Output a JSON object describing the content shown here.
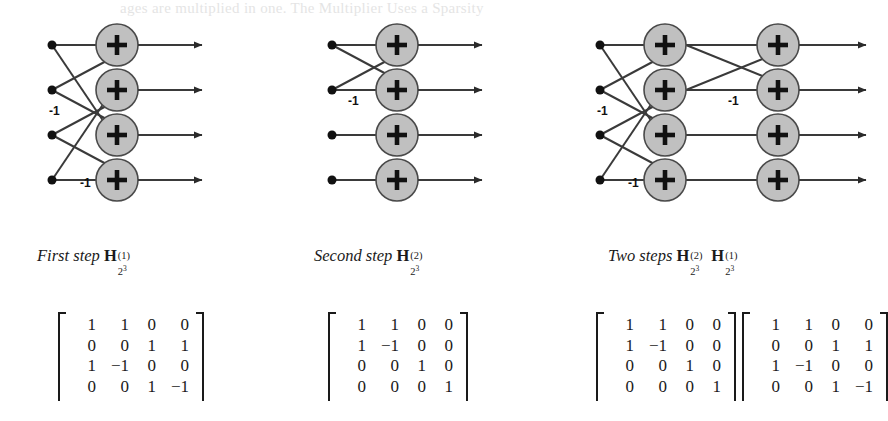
{
  "page": {
    "bleed_text": "ages are multiplied in one.   The Multiplier  Uses a Sparsity",
    "background": "#ffffff",
    "ink_color": "#1a1a1a",
    "node_fill": "#c0c0c0",
    "node_stroke": "#4a4a4a"
  },
  "panels": [
    {
      "id": "first-step",
      "caption": {
        "prefix": "First step ",
        "matrix_symbol": "H",
        "superscript": "(1)",
        "subscript_base": "2",
        "subscript_exp": "3"
      },
      "stages": 1,
      "inputs": 4,
      "adder_glyph": "+",
      "weight_labels": [
        {
          "text": "-1",
          "x": 19,
          "y": 86
        },
        {
          "text": "-1",
          "x": 50,
          "y": 158
        }
      ],
      "stage1_edges": [
        {
          "from": 0,
          "to": 0,
          "sign": "+"
        },
        {
          "from": 1,
          "to": 0,
          "sign": "+"
        },
        {
          "from": 2,
          "to": 1,
          "sign": "+"
        },
        {
          "from": 3,
          "to": 1,
          "sign": "+"
        },
        {
          "from": 0,
          "to": 2,
          "sign": "+"
        },
        {
          "from": 1,
          "to": 2,
          "sign": "-"
        },
        {
          "from": 2,
          "to": 3,
          "sign": "+"
        },
        {
          "from": 3,
          "to": 3,
          "sign": "-"
        }
      ],
      "matrix": {
        "rows": [
          [
            "1",
            "1",
            "0",
            "0"
          ],
          [
            "0",
            "0",
            "1",
            "1"
          ],
          [
            "1",
            "−1",
            "0",
            "0"
          ],
          [
            "0",
            "0",
            "1",
            "−1"
          ]
        ]
      }
    },
    {
      "id": "second-step",
      "caption": {
        "prefix": "Second step ",
        "matrix_symbol": "H",
        "superscript": "(2)",
        "subscript_base": "2",
        "subscript_exp": "3"
      },
      "stages": 1,
      "inputs": 4,
      "adder_glyph": "+",
      "weight_labels": [
        {
          "text": "-1",
          "x": 38,
          "y": 76
        }
      ],
      "stage1_edges": [
        {
          "from": 0,
          "to": 0,
          "sign": "+"
        },
        {
          "from": 1,
          "to": 0,
          "sign": "+"
        },
        {
          "from": 0,
          "to": 1,
          "sign": "+"
        },
        {
          "from": 1,
          "to": 1,
          "sign": "-"
        },
        {
          "from": 2,
          "to": 2,
          "sign": "+"
        },
        {
          "from": 3,
          "to": 3,
          "sign": "+"
        }
      ],
      "matrix": {
        "rows": [
          [
            "1",
            "1",
            "0",
            "0"
          ],
          [
            "1",
            "−1",
            "0",
            "0"
          ],
          [
            "0",
            "0",
            "1",
            "0"
          ],
          [
            "0",
            "0",
            "0",
            "1"
          ]
        ]
      }
    },
    {
      "id": "two-steps",
      "caption": {
        "prefix": "Two steps ",
        "matrix_symbol": "H",
        "superscript": "(2)",
        "subscript_base": "2",
        "subscript_exp": "3",
        "matrix_symbol_2": "H",
        "superscript_2": "(1)",
        "subscript_base_2": "2",
        "subscript_exp_2": "3"
      },
      "stages": 2,
      "inputs": 4,
      "adder_glyph": "+",
      "weight_labels": [
        {
          "text": "-1",
          "x": 19,
          "y": 86
        },
        {
          "text": "-1",
          "x": 50,
          "y": 158
        },
        {
          "text": "-1",
          "x": 150,
          "y": 76
        }
      ],
      "stage1_edges": [
        {
          "from": 0,
          "to": 0,
          "sign": "+"
        },
        {
          "from": 1,
          "to": 0,
          "sign": "+"
        },
        {
          "from": 2,
          "to": 1,
          "sign": "+"
        },
        {
          "from": 3,
          "to": 1,
          "sign": "+"
        },
        {
          "from": 0,
          "to": 2,
          "sign": "+"
        },
        {
          "from": 1,
          "to": 2,
          "sign": "-"
        },
        {
          "from": 2,
          "to": 3,
          "sign": "+"
        },
        {
          "from": 3,
          "to": 3,
          "sign": "-"
        }
      ],
      "stage2_edges": [
        {
          "from": 0,
          "to": 0,
          "sign": "+"
        },
        {
          "from": 1,
          "to": 0,
          "sign": "+"
        },
        {
          "from": 0,
          "to": 1,
          "sign": "+"
        },
        {
          "from": 1,
          "to": 1,
          "sign": "-"
        },
        {
          "from": 2,
          "to": 2,
          "sign": "+"
        },
        {
          "from": 3,
          "to": 3,
          "sign": "+"
        }
      ],
      "matrix": {
        "rows": [
          [
            "1",
            "1",
            "0",
            "0"
          ],
          [
            "1",
            "−1",
            "0",
            "0"
          ],
          [
            "0",
            "0",
            "1",
            "0"
          ],
          [
            "0",
            "0",
            "0",
            "1"
          ]
        ]
      },
      "matrix_2": {
        "rows": [
          [
            "1",
            "1",
            "0",
            "0"
          ],
          [
            "0",
            "0",
            "1",
            "1"
          ],
          [
            "1",
            "−1",
            "0",
            "0"
          ],
          [
            "0",
            "0",
            "1",
            "−1"
          ]
        ]
      }
    }
  ]
}
